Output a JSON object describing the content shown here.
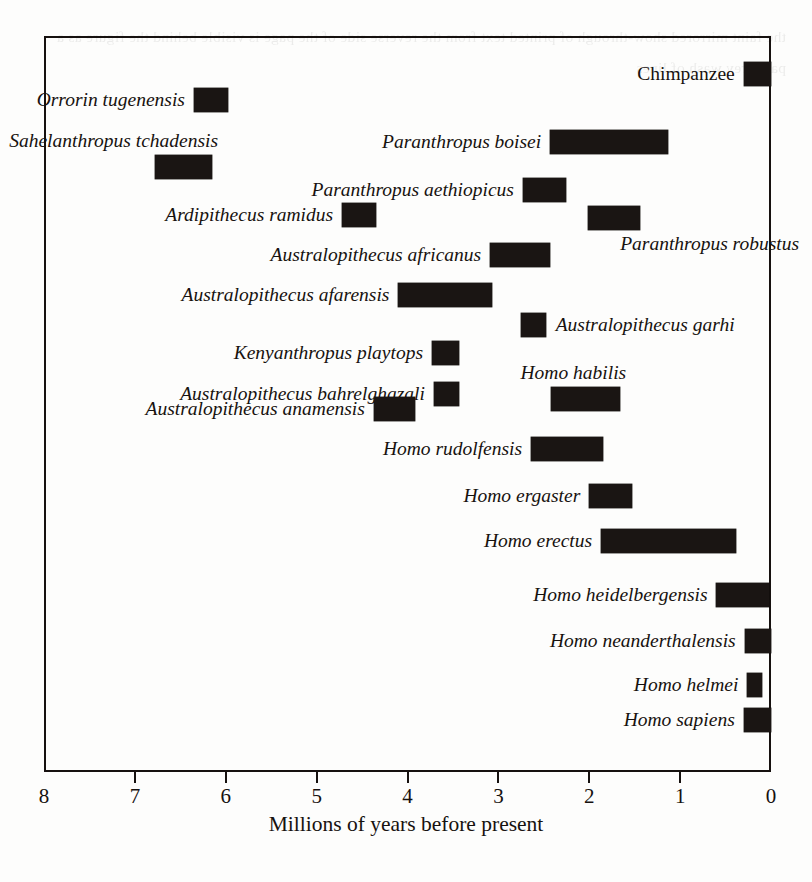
{
  "chart_data": {
    "type": "bar",
    "orientation": "horizontal-range",
    "title": "",
    "xlabel": "Millions of years before present",
    "ylabel": "",
    "xlim": [
      8,
      0
    ],
    "x_reversed": true,
    "xticks": [
      8,
      7,
      6,
      5,
      4,
      3,
      2,
      1,
      0
    ],
    "xtick_labels": [
      "8",
      "7",
      "6",
      "5",
      "4",
      "3",
      "2",
      "1",
      "0"
    ],
    "grid": false,
    "legend": false,
    "axis_color": "#16110f",
    "bar_color": "#1a1513",
    "categories": [
      "Chimpanzee",
      "Orrorin tugenensis",
      "Sahelanthropus tchadensis",
      "Paranthropus boisei",
      "Paranthropus aethiopicus",
      "Ardipithecus ramidus",
      "Paranthropus robustus",
      "Australopithecus africanus",
      "Australopithecus afarensis",
      "Australopithecus garhi",
      "Kenyanthropus playtops",
      "Australopithecus bahrelghazali",
      "Homo habilis",
      "Australopithecus anamensis",
      "Homo rudolfensis",
      "Homo ergaster",
      "Homo erectus",
      "Homo heidelbergensis",
      "Homo neanderthalensis",
      "Homo helmei",
      "Homo sapiens"
    ],
    "ranges_ma": [
      [
        0.3,
        0.0
      ],
      [
        6.35,
        5.97
      ],
      [
        6.78,
        6.15
      ],
      [
        2.43,
        1.13
      ],
      [
        2.73,
        2.26
      ],
      [
        4.72,
        4.35
      ],
      [
        2.01,
        1.44
      ],
      [
        3.09,
        2.43
      ],
      [
        4.1,
        3.07
      ],
      [
        2.75,
        2.48
      ],
      [
        3.73,
        3.43
      ],
      [
        3.71,
        3.43
      ],
      [
        2.42,
        1.66
      ],
      [
        4.37,
        3.92
      ],
      [
        2.64,
        1.85
      ],
      [
        2.0,
        1.53
      ],
      [
        1.87,
        0.39
      ],
      [
        0.6,
        0.02
      ],
      [
        0.29,
        0.0
      ],
      [
        0.26,
        0.1
      ],
      [
        0.3,
        0.0
      ]
    ]
  },
  "rows": [
    {
      "label": "Chimpanzee",
      "start": 0.3,
      "end": 0.0,
      "label_side": "left",
      "italic": false,
      "label_above": false
    },
    {
      "label": "Orrorin tugenensis",
      "start": 6.35,
      "end": 5.97,
      "label_side": "left",
      "italic": true,
      "label_above": false
    },
    {
      "label": "Sahelanthropus tchadensis",
      "start": 6.78,
      "end": 6.15,
      "label_side": "left",
      "italic": true,
      "label_above": true
    },
    {
      "label": "Paranthropus boisei",
      "start": 2.43,
      "end": 1.13,
      "label_side": "left",
      "italic": true,
      "label_above": false
    },
    {
      "label": "Paranthropus aethiopicus",
      "start": 2.73,
      "end": 2.26,
      "label_side": "left",
      "italic": true,
      "label_above": false
    },
    {
      "label": "Ardipithecus ramidus",
      "start": 4.72,
      "end": 4.35,
      "label_side": "left",
      "italic": true,
      "label_above": false
    },
    {
      "label": "Paranthropus robustus",
      "start": 2.01,
      "end": 1.44,
      "label_side": "right",
      "italic": true,
      "label_above": true
    },
    {
      "label": "Australopithecus africanus",
      "start": 3.09,
      "end": 2.43,
      "label_side": "left",
      "italic": true,
      "label_above": false
    },
    {
      "label": "Australopithecus afarensis",
      "start": 4.1,
      "end": 3.07,
      "label_side": "left",
      "italic": true,
      "label_above": false
    },
    {
      "label": "Australopithecus garhi",
      "start": 2.75,
      "end": 2.48,
      "label_side": "right",
      "italic": true,
      "label_above": false
    },
    {
      "label": "Kenyanthropus playtops",
      "start": 3.73,
      "end": 3.43,
      "label_side": "left",
      "italic": true,
      "label_above": false
    },
    {
      "label": "Australopithecus bahrelghazali",
      "start": 3.71,
      "end": 3.43,
      "label_side": "left",
      "italic": true,
      "label_above": false
    },
    {
      "label": "Homo habilis",
      "start": 2.42,
      "end": 1.66,
      "label_side": "left",
      "italic": true,
      "label_above": true
    },
    {
      "label": "Australopithecus anamensis",
      "start": 4.37,
      "end": 3.92,
      "label_side": "left",
      "italic": true,
      "label_above": false
    },
    {
      "label": "Homo rudolfensis",
      "start": 2.64,
      "end": 1.85,
      "label_side": "left",
      "italic": true,
      "label_above": false
    },
    {
      "label": "Homo ergaster",
      "start": 2.0,
      "end": 1.53,
      "label_side": "left",
      "italic": true,
      "label_above": false
    },
    {
      "label": "Homo erectus",
      "start": 1.87,
      "end": 0.39,
      "label_side": "left",
      "italic": true,
      "label_above": false
    },
    {
      "label": "Homo heidelbergensis",
      "start": 0.6,
      "end": 0.02,
      "label_side": "left",
      "italic": true,
      "label_above": false
    },
    {
      "label": "Homo neanderthalensis",
      "start": 0.29,
      "end": 0.0,
      "label_side": "left",
      "italic": true,
      "label_above": false
    },
    {
      "label": "Homo helmei",
      "start": 0.26,
      "end": 0.1,
      "label_side": "left",
      "italic": true,
      "label_above": false
    },
    {
      "label": "Homo sapiens",
      "start": 0.3,
      "end": 0.0,
      "label_side": "left",
      "italic": true,
      "label_above": false
    }
  ],
  "axis": {
    "title": "Millions of years before present",
    "ticks": [
      "8",
      "7",
      "6",
      "5",
      "4",
      "3",
      "2",
      "1",
      "0"
    ]
  },
  "ghost_text": {
    "body": "the faint mirrored show-through of printed text from the reverse side of the page is visible behind the figure as a pale grey wash of lines"
  }
}
